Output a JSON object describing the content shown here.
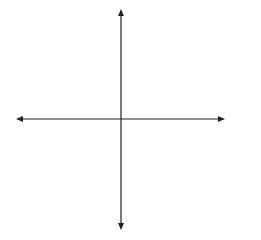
{
  "diagram": {
    "type": "coordinate-plane",
    "axes": {
      "x_label": "x-axis",
      "y_label": "y-axis"
    },
    "grid": {
      "x_min": -5,
      "x_max": 5,
      "y_min": -5,
      "y_max": 5,
      "cells": 10
    },
    "triangle": {
      "vertices": [
        {
          "label": "X",
          "x": 2,
          "y": 0
        },
        {
          "label": "W",
          "x": 5,
          "y": -2
        },
        {
          "label": "Y",
          "x": 1,
          "y": -4
        }
      ]
    },
    "colors": {
      "grid": "#9a9a9a",
      "axis": "#222222",
      "triangle": "#1a1a1a"
    }
  }
}
